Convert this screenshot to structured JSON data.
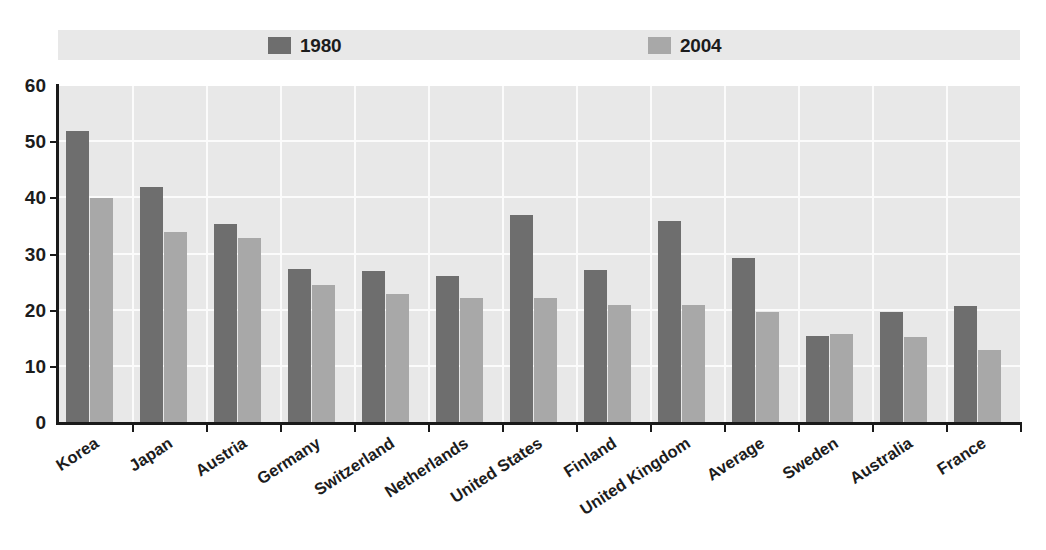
{
  "chart_data": {
    "type": "bar",
    "title": "",
    "subtitle": "",
    "xlabel": "",
    "ylabel": "",
    "ylim": [
      0,
      60
    ],
    "yticks": [
      0,
      10,
      20,
      30,
      40,
      50,
      60
    ],
    "grid": true,
    "legend_position": "top",
    "categories": [
      "Korea",
      "Japan",
      "Austria",
      "Germany",
      "Switzerland",
      "Netherlands",
      "United States",
      "Finland",
      "United Kingdom",
      "Average",
      "Sweden",
      "Australia",
      "France"
    ],
    "series": [
      {
        "name": "1980",
        "color": "#6e6e6e",
        "values": [
          52.0,
          42.0,
          35.5,
          27.5,
          27.0,
          26.2,
          37.0,
          27.3,
          36.0,
          29.4,
          15.5,
          19.8,
          20.8
        ]
      },
      {
        "name": "2004",
        "color": "#a8a8a8",
        "values": [
          40.0,
          34.0,
          33.0,
          24.5,
          23.0,
          22.3,
          22.2,
          21.0,
          21.0,
          19.8,
          15.8,
          15.4,
          13.0
        ]
      }
    ]
  },
  "legend": {
    "entries": [
      {
        "label": "1980",
        "color": "#6e6e6e"
      },
      {
        "label": "2004",
        "color": "#a8a8a8"
      }
    ]
  },
  "axes": {
    "y_tick_labels": [
      "0",
      "10",
      "20",
      "30",
      "40",
      "50",
      "60"
    ]
  },
  "colors": {
    "series_1980": "#6e6e6e",
    "series_2004": "#a8a8a8",
    "plot_background": "#e8e8e8",
    "gridline": "#fbfbfb",
    "axis": "#1a1a1a",
    "text": "#1c1c1c"
  }
}
